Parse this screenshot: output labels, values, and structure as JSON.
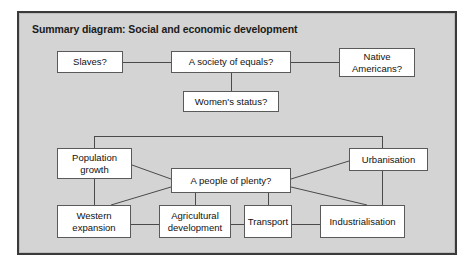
{
  "diagram": {
    "title": "Summary diagram: Social and economic development",
    "background_color": "#d4d4d4",
    "frame_color": "#3a3a3a",
    "node_fill": "#ffffff",
    "node_border": "#5a5a5a",
    "connector_color": "#4a4a4a",
    "nodes": [
      {
        "id": "slaves",
        "label": "Slaves?"
      },
      {
        "id": "society",
        "label": "A society of equals?"
      },
      {
        "id": "native",
        "label": "Native\nAmericans?"
      },
      {
        "id": "women",
        "label": "Women's status?"
      },
      {
        "id": "population",
        "label": "Population\ngrowth"
      },
      {
        "id": "plenty",
        "label": "A people of plenty?"
      },
      {
        "id": "urbanisation",
        "label": "Urbanisation"
      },
      {
        "id": "western",
        "label": "Western\nexpansion"
      },
      {
        "id": "agricultural",
        "label": "Agricultural\ndevelopment"
      },
      {
        "id": "transport",
        "label": "Transport"
      },
      {
        "id": "industrial",
        "label": "Industrialisation"
      }
    ],
    "edges": [
      {
        "from": "slaves",
        "to": "society"
      },
      {
        "from": "society",
        "to": "native"
      },
      {
        "from": "society",
        "to": "women"
      },
      {
        "from": "population",
        "to": "urbanisation"
      },
      {
        "from": "population",
        "to": "plenty"
      },
      {
        "from": "population",
        "to": "western"
      },
      {
        "from": "plenty",
        "to": "urbanisation"
      },
      {
        "from": "plenty",
        "to": "western"
      },
      {
        "from": "plenty",
        "to": "agricultural"
      },
      {
        "from": "plenty",
        "to": "transport"
      },
      {
        "from": "plenty",
        "to": "industrial"
      },
      {
        "from": "urbanisation",
        "to": "industrial"
      },
      {
        "from": "western",
        "to": "agricultural"
      },
      {
        "from": "agricultural",
        "to": "transport"
      },
      {
        "from": "transport",
        "to": "industrial"
      }
    ]
  }
}
